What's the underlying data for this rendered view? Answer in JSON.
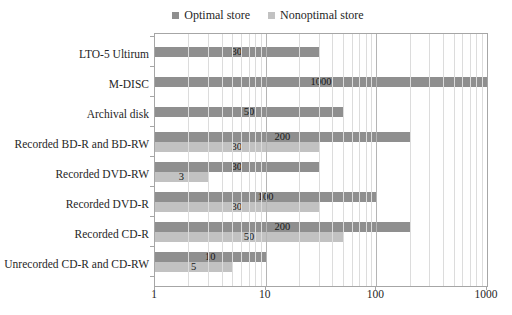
{
  "legend": {
    "optimal_label": "Optimal store",
    "nonoptimal_label": "Nonoptimal store"
  },
  "colors": {
    "optimal_bar": "#8f8f8f",
    "nonoptimal_bar": "#c2c2c2",
    "grid_minor": "#dcdcdc",
    "grid_major": "#b5b5b5",
    "axis_border": "#a6a6a6",
    "label_text": "#161616"
  },
  "chart_data": {
    "type": "bar",
    "orientation": "horizontal",
    "x_scale": "log",
    "xlim": [
      1,
      1000
    ],
    "x_ticks": [
      1,
      10,
      100,
      1000
    ],
    "grid": true,
    "legend_position": "top",
    "data_labels": true,
    "title": "",
    "xlabel": "",
    "ylabel": "",
    "categories": [
      "LTO-5 Ultirum",
      "M-DISC",
      "Archival disk",
      "Recorded BD-R and BD-RW",
      "Recorded DVD-RW",
      "Recorded DVD-R",
      "Recorded CD-R",
      "Unrecorded CD-R and CD-RW"
    ],
    "series": [
      {
        "name": "Optimal store",
        "values": [
          30,
          1000,
          50,
          200,
          30,
          100,
          200,
          10
        ]
      },
      {
        "name": "Nonoptimal store",
        "values": [
          null,
          null,
          null,
          30,
          3,
          30,
          50,
          5
        ]
      }
    ]
  }
}
